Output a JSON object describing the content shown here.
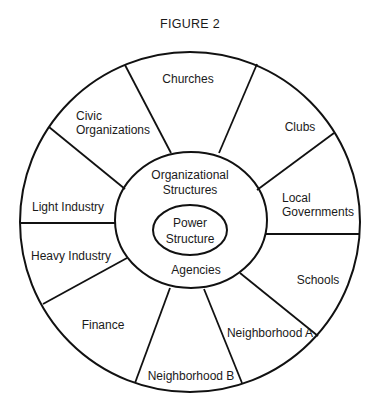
{
  "figure": {
    "title": "FIGURE 2",
    "center": {
      "label_line1": "Power",
      "label_line2": "Structure"
    },
    "middle_ring": {
      "top_line1": "Organizational",
      "top_line2": "Structures",
      "bottom": "Agencies"
    },
    "segments": [
      {
        "id": "churches",
        "line1": "Churches",
        "line2": ""
      },
      {
        "id": "clubs",
        "line1": "Clubs",
        "line2": ""
      },
      {
        "id": "local-governments",
        "line1": "Local",
        "line2": "Governments"
      },
      {
        "id": "schools",
        "line1": "Schools",
        "line2": ""
      },
      {
        "id": "neighborhood-a",
        "line1": "Neighborhood A",
        "line2": ""
      },
      {
        "id": "neighborhood-b",
        "line1": "Neighborhood B",
        "line2": ""
      },
      {
        "id": "finance",
        "line1": "Finance",
        "line2": ""
      },
      {
        "id": "heavy-industry",
        "line1": "Heavy Industry",
        "line2": ""
      },
      {
        "id": "light-industry",
        "line1": "Light Industry",
        "line2": ""
      },
      {
        "id": "civic-organizations",
        "line1": "Civic",
        "line2": "Organizations"
      }
    ],
    "colors": {
      "stroke": "#111111",
      "text": "#1a1a1a",
      "background": "#ffffff"
    }
  }
}
